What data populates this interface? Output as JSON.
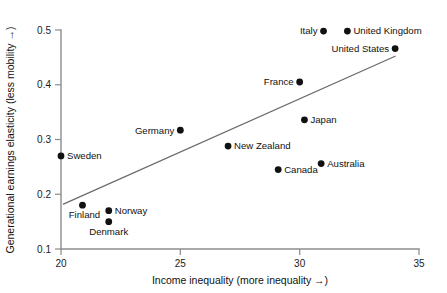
{
  "chart_data": {
    "type": "scatter",
    "title": "",
    "xlabel": "Income inequality (more inequality →)",
    "ylabel": "Generational earnings elasticity (less mobility →)",
    "xlim": [
      20,
      35
    ],
    "ylim": [
      0.1,
      0.5
    ],
    "xticks": [
      "20",
      "25",
      "30",
      "35"
    ],
    "xtick_values": [
      20,
      25,
      30,
      35
    ],
    "yticks": [
      "0.1",
      "0.2",
      "0.3",
      "0.4",
      "0.5"
    ],
    "ytick_values": [
      0.1,
      0.2,
      0.3,
      0.4,
      0.5
    ],
    "grid": false,
    "legend": "none",
    "marker_color": "#111111",
    "trend_color": "#6b6b6b",
    "axis_color": "#8c8c8c",
    "points": [
      {
        "label": "Sweden",
        "x": 20.0,
        "y": 0.27,
        "label_pos": "right"
      },
      {
        "label": "Finland",
        "x": 20.9,
        "y": 0.18,
        "label_pos": "below-left"
      },
      {
        "label": "Norway",
        "x": 22.0,
        "y": 0.17,
        "label_pos": "right"
      },
      {
        "label": "Denmark",
        "x": 22.0,
        "y": 0.15,
        "label_pos": "below"
      },
      {
        "label": "Germany",
        "x": 25.0,
        "y": 0.317,
        "label_pos": "left"
      },
      {
        "label": "New Zealand",
        "x": 27.0,
        "y": 0.288,
        "label_pos": "right"
      },
      {
        "label": "Canada",
        "x": 29.1,
        "y": 0.245,
        "label_pos": "right"
      },
      {
        "label": "France",
        "x": 30.0,
        "y": 0.405,
        "label_pos": "left"
      },
      {
        "label": "Italy",
        "x": 31.0,
        "y": 0.498,
        "label_pos": "left"
      },
      {
        "label": "Japan",
        "x": 30.2,
        "y": 0.336,
        "label_pos": "right"
      },
      {
        "label": "Australia",
        "x": 30.9,
        "y": 0.256,
        "label_pos": "right"
      },
      {
        "label": "United Kingdom",
        "x": 32.0,
        "y": 0.498,
        "label_pos": "right"
      },
      {
        "label": "United States",
        "x": 34.0,
        "y": 0.466,
        "label_pos": "left"
      }
    ],
    "trend_line": {
      "x_start": 20.1,
      "y_start": 0.182,
      "x_end": 34.0,
      "y_end": 0.452
    }
  }
}
